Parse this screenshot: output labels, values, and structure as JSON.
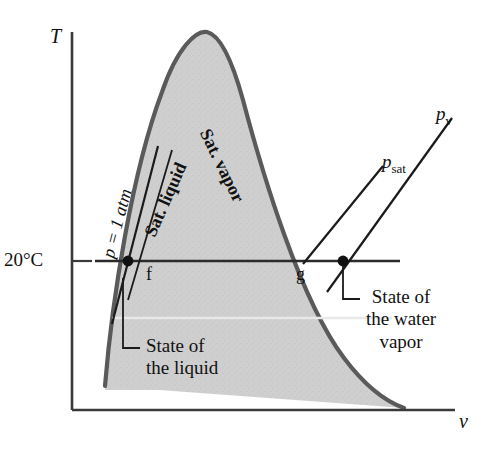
{
  "figure": {
    "type": "T-v phase diagram for water",
    "axes": {
      "y_label": "T",
      "x_label": "v",
      "y_tick_label": "20°C"
    },
    "dome_labels": {
      "sat_liquid": "Sat. liquid",
      "sat_vapor": "Sat. vapor"
    },
    "state_points": {
      "f": "f",
      "g": "g"
    },
    "pressure_lines": {
      "p_one_atm": "p = 1 atm",
      "p_sat_symbol": "p",
      "p_sat_sub": "sat",
      "p_v_symbol": "p",
      "p_v_sub": "v"
    },
    "callouts": {
      "liquid": {
        "line1": "State of",
        "line2": "the liquid"
      },
      "vapor": {
        "line1": "State of",
        "line2": "the water",
        "line3": "vapor"
      }
    },
    "colors": {
      "dome_fill": "#cccccc",
      "dome_stroke": "#555555",
      "line": "#1a1a1a",
      "text": "#111111"
    }
  }
}
